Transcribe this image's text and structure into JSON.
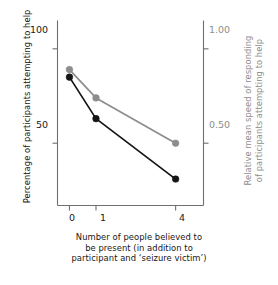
{
  "chart_data": {
    "type": "line",
    "title": "",
    "subtitle": "",
    "xlabel_lines": [
      "Number of people believed to",
      "be present (in addition to",
      "participant and ‘seizure victim’)"
    ],
    "xlabel": "Number of people believed to be present (in addition to participant and ‘seizure victim’)",
    "ylabel_left": "Percentage of participants attempting to help",
    "ylabel_right_lines": [
      "Relative mean speed of responding",
      "of participants attempting to help"
    ],
    "ylabel_right": "Relative mean speed of responding of participants attempting to help",
    "categories": [
      "0",
      "1",
      "4"
    ],
    "x": [
      0,
      1,
      4
    ],
    "xlim": [
      -0.45,
      5.05
    ],
    "xticks": [
      "0",
      "1",
      "4"
    ],
    "grid": false,
    "legend": "none",
    "axis_left": {
      "ticks": [
        100,
        50
      ],
      "tick_labels": [
        "100",
        "50"
      ],
      "ylim": [
        17,
        115
      ],
      "color": "#1a1a1a"
    },
    "axis_right": {
      "ticks": [
        1.0,
        0.5
      ],
      "tick_labels": [
        "1.00",
        "0.50"
      ],
      "ylim": [
        0.17,
        1.15
      ],
      "color": "#8d8d8d"
    },
    "series": [
      {
        "name": "Percentage of participants attempting to help",
        "axis": "left",
        "color": "#151515",
        "marker": "circle",
        "values": [
          85,
          63,
          31
        ]
      },
      {
        "name": "Relative mean speed of responding",
        "axis": "right",
        "color": "#8d8d8d",
        "marker": "circle",
        "values": [
          0.89,
          0.74,
          0.5
        ]
      }
    ]
  },
  "colors": {
    "series_black": "#151515",
    "series_gray": "#8d8d8d",
    "frame": "#6f6f6f",
    "background": "#ffffff"
  }
}
